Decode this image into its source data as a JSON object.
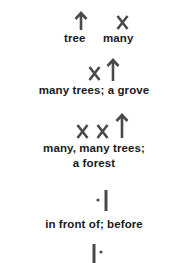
{
  "entries": [
    {
      "symbols": [
        "tree-arrow",
        "x-mark"
      ],
      "labels": [
        "tree",
        "many"
      ]
    },
    {
      "symbols": [
        "x-mark",
        "tree-arrow"
      ],
      "label": "many trees; a grove"
    },
    {
      "symbols": [
        "x-mark",
        "x-mark",
        "tree-arrow"
      ],
      "label_line1": "many, many trees;",
      "label_line2": "a forest"
    },
    {
      "symbols": [
        "dot",
        "bar"
      ],
      "label": "in front of; before"
    },
    {
      "symbols": [
        "bar",
        "dot"
      ]
    }
  ],
  "colors": {
    "ink": "#4a4a4a",
    "text": "#1a1a1a",
    "background": "#ffffff"
  }
}
